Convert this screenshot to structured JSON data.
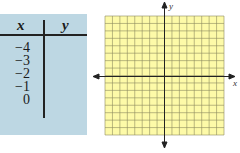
{
  "table": {
    "headers": {
      "x": "x",
      "y": "y"
    },
    "rows": [
      {
        "x": "−4",
        "y": ""
      },
      {
        "x": "−3",
        "y": ""
      },
      {
        "x": "−2",
        "y": ""
      },
      {
        "x": "−1",
        "y": ""
      },
      {
        "x": "0",
        "y": ""
      }
    ]
  },
  "graph": {
    "x_label": "x",
    "y_label": "y",
    "grid_squares": 16,
    "grid_color": "#fdfaa8",
    "line_color": "#8a8a5a",
    "axis_color": "#222222"
  },
  "colors": {
    "table_bg": "#bdd7e3",
    "grid_bg": "#fdfaa8"
  }
}
